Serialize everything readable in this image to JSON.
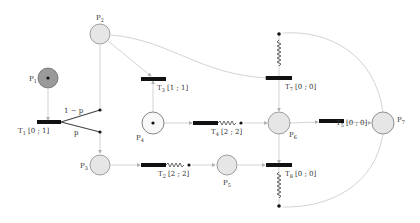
{
  "diagram": {
    "type": "petri-net",
    "colors": {
      "arc": "#c8c8c8",
      "place_fill": "#e6e6e6",
      "place_stroke": "#888888",
      "marked_place_fill": "#9a9a9a",
      "transition": "#111111",
      "label": "#333333"
    },
    "places": [
      {
        "id": "P1",
        "label": "P",
        "sub": "1",
        "tokens": 1,
        "style": "dark"
      },
      {
        "id": "P2",
        "label": "P",
        "sub": "2",
        "tokens": 0,
        "style": "light"
      },
      {
        "id": "P3",
        "label": "P",
        "sub": "3",
        "tokens": 0,
        "style": "light"
      },
      {
        "id": "P4",
        "label": "P",
        "sub": "4",
        "tokens": 1,
        "style": "white"
      },
      {
        "id": "P5",
        "label": "P",
        "sub": "5",
        "tokens": 0,
        "style": "light"
      },
      {
        "id": "P6",
        "label": "P",
        "sub": "6",
        "tokens": 0,
        "style": "light"
      },
      {
        "id": "P7",
        "label": "P",
        "sub": "7",
        "tokens": 0,
        "style": "light"
      }
    ],
    "transitions": [
      {
        "id": "T1",
        "label": "T",
        "sub": "1",
        "interval": " [0 ; 1]"
      },
      {
        "id": "T2",
        "label": "T",
        "sub": "2",
        "interval": " [2 ; 2]"
      },
      {
        "id": "T3",
        "label": "T",
        "sub": "3",
        "interval": " [1 ; 1]"
      },
      {
        "id": "T4",
        "label": "T",
        "sub": "4",
        "interval": " [2 ; 2]"
      },
      {
        "id": "T5",
        "label": "T",
        "sub": "5",
        "interval": " [0 ; 0]"
      },
      {
        "id": "T7",
        "label": "T",
        "sub": "7",
        "interval": " [0 ; 0]"
      },
      {
        "id": "T8",
        "label": "T",
        "sub": "8",
        "interval": " [0 ; 0]"
      }
    ],
    "probabilities": {
      "upper": "1 − p",
      "lower": "p"
    },
    "arcs": [
      "P1→T1",
      "T1→P2 (1−p)",
      "T1→P3 (p)",
      "P2→T3",
      "T3→P4",
      "P2→T7",
      "P4→T4",
      "T4→P6",
      "P3→T2",
      "T2→P5",
      "P5→T8",
      "P6→T5",
      "T5→P7",
      "P6→T7",
      "P6→T8",
      "P7→T7",
      "P7→T8"
    ]
  }
}
